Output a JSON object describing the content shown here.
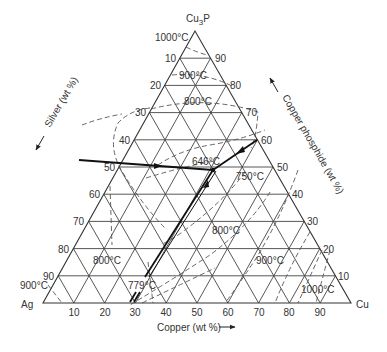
{
  "chart_data": {
    "type": "ternary-phase-diagram",
    "title": "",
    "vertices": {
      "top": "Cu3P",
      "left": "Ag",
      "right": "Cu"
    },
    "vertex_labels": {
      "top_main": "Cu",
      "top_sub": "3",
      "top_end": "P",
      "left": "Ag",
      "right": "Cu"
    },
    "axes": {
      "bottom": {
        "title": "Copper (wt %)",
        "ticks": [
          "10",
          "20",
          "30",
          "40",
          "50",
          "60",
          "70",
          "80",
          "90"
        ],
        "arrow": "right"
      },
      "left": {
        "title": "Silver (wt %)",
        "ticks": [
          "10",
          "20",
          "30",
          "40",
          "50",
          "60",
          "70",
          "80",
          "90"
        ],
        "arrow": "down-left"
      },
      "right": {
        "title": "Copper phosphide (wt %)",
        "ticks": [
          "90",
          "80",
          "70",
          "60",
          "50",
          "40",
          "30",
          "20",
          "10"
        ],
        "arrow": "up-left"
      }
    },
    "grid": {
      "step_percent": 10,
      "on": true
    },
    "isotherm_labels": [
      {
        "text": "1000°C",
        "position": "near Cu3P apex"
      },
      {
        "text": "900°C",
        "position": "upper region near Cu3P"
      },
      {
        "text": "800°C",
        "position": "upper region"
      },
      {
        "text": "646°C",
        "position": "ternary eutectic"
      },
      {
        "text": "750°C",
        "position": "right of eutectic"
      },
      {
        "text": "800°C",
        "position": "center-right"
      },
      {
        "text": "900°C",
        "position": "lower right"
      },
      {
        "text": "1000°C",
        "position": "near Cu corner"
      },
      {
        "text": "800°C",
        "position": "lower left"
      },
      {
        "text": "900°C",
        "position": "near Ag corner"
      },
      {
        "text": "779°C",
        "position": "Ag-Cu binary eutectic"
      }
    ],
    "eutectic_point": {
      "temperature": "646°C",
      "approx_composition_wt_pct": {
        "Cu3P": 50,
        "Ag": 22,
        "Cu": 28
      }
    },
    "binary_eutectics": [
      {
        "label": "646°C valley from Ag–Cu3P side",
        "start_wt_pct_Cu3P": 48
      },
      {
        "label": "from Cu–Cu3P side",
        "start_wt_pct_Cu3P": 60
      },
      {
        "label": "779°C Ag–Cu eutectic",
        "start_wt_pct_Cu": 28
      }
    ]
  },
  "labels": {
    "top_main": "Cu",
    "top_sub": "3",
    "top_end": "P",
    "left_vertex": "Ag",
    "right_vertex": "Cu",
    "bottom_title": "Copper (wt %)",
    "left_title": "Silver (wt %)",
    "right_title": "Copper phosphide (wt %)",
    "left_ticks": [
      "10",
      "20",
      "30",
      "40",
      "50",
      "60",
      "70",
      "80",
      "90"
    ],
    "right_ticks": [
      "90",
      "80",
      "70",
      "60",
      "50",
      "40",
      "30",
      "20",
      "10"
    ],
    "bottom_ticks": [
      "10",
      "20",
      "30",
      "40",
      "50",
      "60",
      "70",
      "80",
      "90"
    ],
    "temps": {
      "t1000_top": "1000°C",
      "t900_top": "900°C",
      "t800_top": "800°C",
      "t646": "646°C",
      "t750": "750°C",
      "t800_mid": "800°C",
      "t900_right": "900°C",
      "t1000_right": "1000°C",
      "t800_left": "800°C",
      "t900_left": "900°C",
      "t779": "779°C"
    }
  }
}
